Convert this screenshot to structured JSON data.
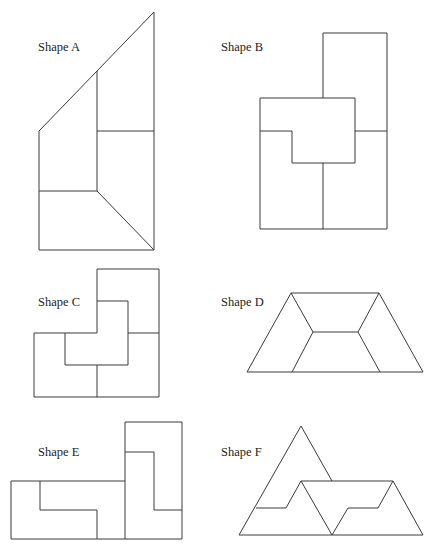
{
  "shapes": [
    {
      "id": "A",
      "label": "Shape A",
      "label_pos": [
        38,
        41
      ],
      "polylines": [
        [
          [
            154,
            12
          ],
          [
            39,
            131
          ],
          [
            39,
            250
          ],
          [
            154,
            250
          ],
          [
            154,
            12
          ]
        ],
        [
          [
            97,
            71
          ],
          [
            97,
            191
          ]
        ],
        [
          [
            97,
            131
          ],
          [
            154,
            131
          ]
        ],
        [
          [
            39,
            191
          ],
          [
            97,
            191
          ]
        ],
        [
          [
            97,
            191
          ],
          [
            154,
            250
          ]
        ]
      ]
    },
    {
      "id": "B",
      "label": "Shape B",
      "label_pos": [
        221,
        41
      ],
      "polylines": [
        [
          [
            323,
            33
          ],
          [
            387,
            33
          ],
          [
            387,
            229
          ],
          [
            260,
            229
          ],
          [
            260,
            98
          ],
          [
            323,
            98
          ],
          [
            323,
            33
          ]
        ],
        [
          [
            323,
            98
          ],
          [
            355,
            98
          ],
          [
            355,
            163
          ],
          [
            292,
            163
          ],
          [
            292,
            131
          ],
          [
            260,
            131
          ]
        ],
        [
          [
            355,
            131
          ],
          [
            387,
            131
          ]
        ],
        [
          [
            323,
            163
          ],
          [
            323,
            229
          ]
        ]
      ]
    },
    {
      "id": "C",
      "label": "Shape C",
      "label_pos": [
        38,
        296
      ],
      "polylines": [
        [
          [
            97,
            269
          ],
          [
            159,
            269
          ],
          [
            159,
            397
          ],
          [
            34,
            397
          ],
          [
            34,
            333
          ],
          [
            97,
            333
          ],
          [
            97,
            269
          ]
        ],
        [
          [
            97,
            301
          ],
          [
            128,
            301
          ],
          [
            128,
            365
          ],
          [
            65,
            365
          ],
          [
            65,
            333
          ]
        ],
        [
          [
            128,
            333
          ],
          [
            159,
            333
          ]
        ],
        [
          [
            97,
            365
          ],
          [
            97,
            397
          ]
        ]
      ]
    },
    {
      "id": "D",
      "label": "Shape D",
      "label_pos": [
        221,
        296
      ],
      "polylines": [
        [
          [
            291,
            293
          ],
          [
            379,
            293
          ],
          [
            423,
            372
          ],
          [
            247,
            372
          ],
          [
            291,
            293
          ]
        ],
        [
          [
            291,
            293
          ],
          [
            313,
            332
          ],
          [
            358,
            332
          ],
          [
            379,
            293
          ]
        ],
        [
          [
            313,
            332
          ],
          [
            292,
            372
          ]
        ],
        [
          [
            358,
            332
          ],
          [
            380,
            372
          ]
        ]
      ]
    },
    {
      "id": "E",
      "label": "Shape E",
      "label_pos": [
        38,
        446
      ],
      "polylines": [
        [
          [
            125,
            422
          ],
          [
            182,
            422
          ],
          [
            182,
            539
          ],
          [
            11,
            539
          ],
          [
            11,
            481
          ],
          [
            125,
            481
          ]
        ],
        [
          [
            125,
            422
          ],
          [
            125,
            539
          ]
        ],
        [
          [
            125,
            452
          ],
          [
            154,
            452
          ],
          [
            154,
            510
          ],
          [
            182,
            510
          ]
        ],
        [
          [
            40,
            481
          ],
          [
            40,
            510
          ],
          [
            97,
            510
          ],
          [
            97,
            539
          ]
        ]
      ]
    },
    {
      "id": "F",
      "label": "Shape F",
      "label_pos": [
        221,
        446
      ],
      "polylines": [
        [
          [
            301,
            426
          ],
          [
            239,
            535
          ],
          [
            423,
            535
          ],
          [
            393,
            481
          ],
          [
            301,
            481
          ]
        ],
        [
          [
            301,
            426
          ],
          [
            332,
            481
          ]
        ],
        [
          [
            256,
            508
          ],
          [
            286,
            508
          ],
          [
            301,
            481
          ],
          [
            332,
            535
          ]
        ],
        [
          [
            332,
            535
          ],
          [
            348,
            508
          ],
          [
            378,
            508
          ],
          [
            393,
            481
          ]
        ]
      ]
    }
  ],
  "style": {
    "line_color": "#3a3a3a",
    "background": "#ffffff",
    "label_color": "#222222"
  }
}
